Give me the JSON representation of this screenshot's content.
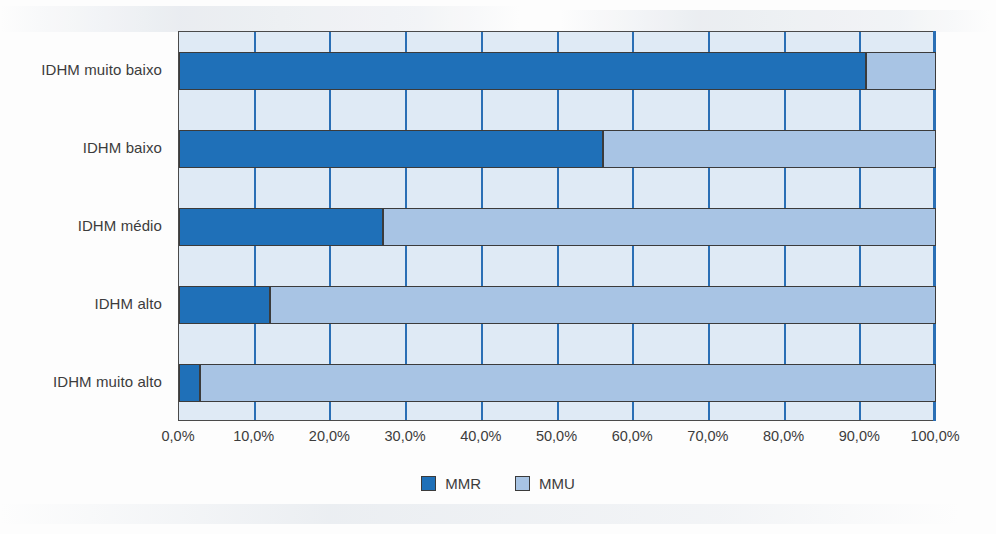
{
  "chart_data": {
    "type": "bar",
    "orientation": "horizontal",
    "stacked": true,
    "stack_mode": "percent",
    "title": "",
    "subtitle": "",
    "xlabel": "",
    "ylabel": "",
    "xlim": [
      0,
      100
    ],
    "xticks": [
      0,
      10,
      20,
      30,
      40,
      50,
      60,
      70,
      80,
      90,
      100
    ],
    "xtick_labels": [
      "0,0%",
      "10,0%",
      "20,0%",
      "30,0%",
      "40,0%",
      "50,0%",
      "60,0%",
      "70,0%",
      "80,0%",
      "90,0%",
      "100,0%"
    ],
    "grid": "vertical",
    "legend_position": "bottom-center",
    "categories": [
      "IDHM muito baixo",
      "IDHM baixo",
      "IDHM médio",
      "IDHM alto",
      "IDHM muito alto"
    ],
    "series": [
      {
        "name": "MMR",
        "color": "#1f70b8",
        "values": [
          90.7,
          56.0,
          27.0,
          12.0,
          2.8
        ]
      },
      {
        "name": "MMU",
        "color": "#a8c4e4",
        "values": [
          9.3,
          44.0,
          73.0,
          88.0,
          97.2
        ]
      }
    ],
    "annotations": []
  },
  "legend": {
    "items": [
      {
        "label": "MMR",
        "color": "#1f70b8"
      },
      {
        "label": "MMU",
        "color": "#a8c4e4"
      }
    ]
  },
  "colors": {
    "series_mmr": "#1f70b8",
    "series_mmu": "#a8c4e4",
    "plot_background": "#dfeaf5",
    "gridline": "#2a6fb5",
    "bar_outline": "#3b3b3b",
    "text": "#3c3c3c",
    "page_background": "#fdfdfd"
  }
}
